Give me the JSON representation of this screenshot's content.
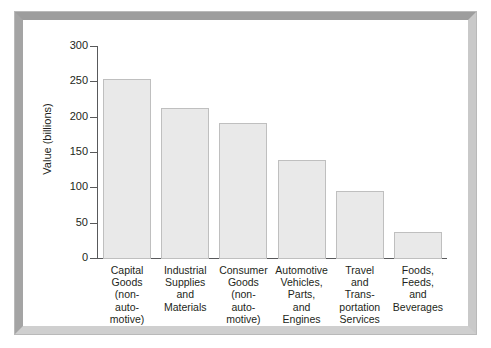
{
  "chart_data": {
    "type": "bar",
    "title": "",
    "subtitle": "",
    "xlabel": "",
    "ylabel": "Value (billions)",
    "ylim": [
      0,
      300
    ],
    "yticks": [
      0,
      50,
      100,
      150,
      200,
      250,
      300
    ],
    "ytick_labels": [
      "0",
      "50",
      "100",
      "150",
      "200",
      "250",
      "300"
    ],
    "grid": false,
    "legend": false,
    "legend_position": "none",
    "categories": [
      "Capital Goods (non-automotive)",
      "Industrial Supplies and Materials",
      "Consumer Goods (non-automotive)",
      "Automotive Vehicles, Parts, and Engines",
      "Travel and Transportation Services",
      "Foods, Feeds, and Beverages"
    ],
    "category_label_lines": [
      [
        "Capital",
        "Goods",
        "(non-",
        "auto-",
        "motive)"
      ],
      [
        "Industrial",
        "Supplies",
        "and",
        "Materials"
      ],
      [
        "Consumer",
        "Goods",
        "(non-",
        "auto-",
        "motive)"
      ],
      [
        "Automotive",
        "Vehicles,",
        "Parts,",
        "and",
        "Engines"
      ],
      [
        "Travel",
        "and",
        "Trans-",
        "portation",
        "Services"
      ],
      [
        "Foods,",
        "Feeds,",
        "and",
        "Beverages"
      ]
    ],
    "values": [
      255,
      214,
      192,
      140,
      96,
      38
    ],
    "bar_fill_color": "#e9e9e9",
    "bar_border_color": "#bfbfbf",
    "axis_color": "#58595b",
    "text_color": "#231f20",
    "frame_color": "#b5b5b5",
    "background_color": "#ffffff"
  }
}
